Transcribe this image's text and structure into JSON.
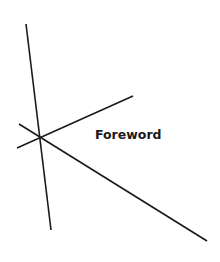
{
  "page": {
    "title": "Foreword",
    "colors": {
      "background": "#ffffff",
      "ink": "#1a1a1a"
    }
  },
  "decoration": {
    "lines": [
      {
        "x1": 26,
        "y1": 24,
        "x2": 51,
        "y2": 230
      },
      {
        "x1": 17,
        "y1": 148,
        "x2": 133,
        "y2": 96
      },
      {
        "x1": 19,
        "y1": 124,
        "x2": 207,
        "y2": 241
      }
    ]
  }
}
